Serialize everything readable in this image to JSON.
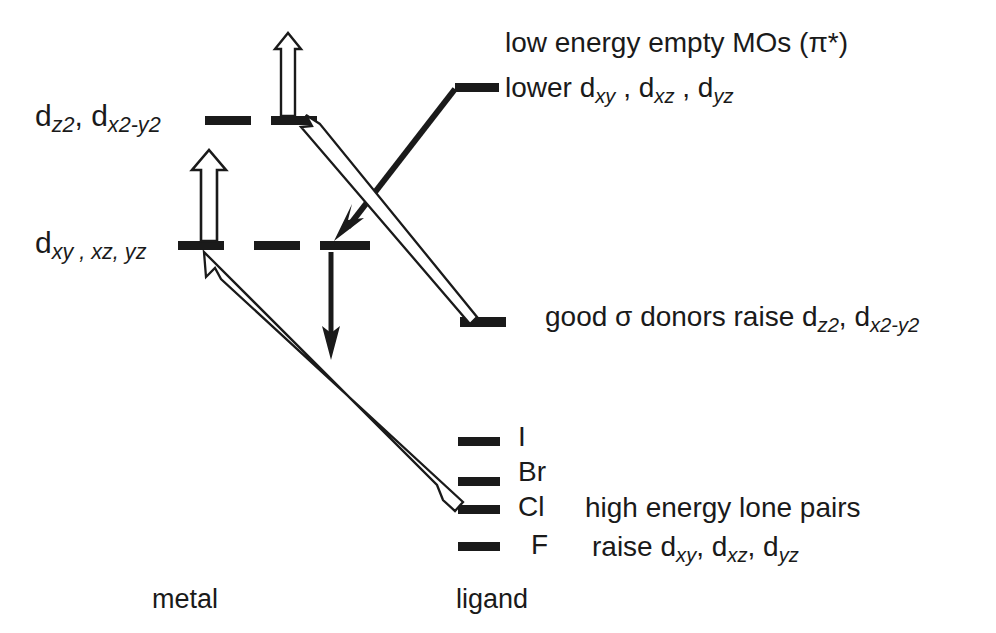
{
  "diagram": {
    "colors": {
      "level_bar": "#1a1a1a",
      "outline_arrow_fill": "#ffffff",
      "outline_arrow_stroke": "#1a1a1a",
      "solid_arrow": "#1a1a1a",
      "background": "#ffffff",
      "text": "#1a1a1a"
    },
    "axis_labels": {
      "metal": "metal",
      "ligand": "ligand"
    },
    "metal_levels": [
      {
        "id": "eg",
        "label_plain": "dz2, dx2-y2",
        "label_parts": [
          {
            "text": "d"
          },
          {
            "sub": "z2"
          },
          {
            "text": ", d"
          },
          {
            "sub": "x2-y2"
          }
        ],
        "bars": 2
      },
      {
        "id": "t2g",
        "label_plain": "dxy , xz, yz",
        "label_parts": [
          {
            "text": "d"
          },
          {
            "sub": "xy , xz, yz"
          }
        ],
        "bars": 3
      }
    ],
    "ligand_levels": [
      {
        "id": "pi-star",
        "annotation_line1": "low energy empty MOs (π*)",
        "annotation_line2": "lower dxy , dxz , dyz"
      },
      {
        "id": "sigma-donor",
        "annotation": "good σ donors raise dz2, dx2-y2"
      },
      {
        "id": "lone-pair-I",
        "label": "I"
      },
      {
        "id": "lone-pair-Br",
        "label": "Br"
      },
      {
        "id": "lone-pair-Cl",
        "label": "Cl"
      },
      {
        "id": "lone-pair-F",
        "label": "F"
      }
    ],
    "annotations": {
      "pi_star_line1": "low energy empty MOs (π*)",
      "pi_star_line2_prefix": "lower d",
      "pi_star_line2_sub1": "xy",
      "pi_star_line2_mid1": " , d",
      "pi_star_line2_sub2": "xz",
      "pi_star_line2_mid2": " , d",
      "pi_star_line2_sub3": "yz",
      "sigma_prefix": "good σ donors raise d",
      "sigma_sub1": "z2",
      "sigma_mid": ", d",
      "sigma_sub2": "x2-y2",
      "halide_I": "I",
      "halide_Br": "Br",
      "halide_Cl": "Cl",
      "halide_F": "F",
      "high_energy": "high energy lone pairs",
      "raise_prefix": "raise d",
      "raise_sub1": "xy",
      "raise_mid1": ", d",
      "raise_sub2": "xz",
      "raise_mid2": ", d",
      "raise_sub3": "yz"
    },
    "arrows": [
      {
        "id": "eg-up-outline",
        "style": "outline",
        "direction": "up",
        "meaning": "sigma donation raises eg"
      },
      {
        "id": "t2g-up-outline",
        "style": "outline",
        "direction": "up",
        "meaning": "lone pairs raise t2g"
      },
      {
        "id": "t2g-down-solid",
        "style": "solid",
        "direction": "down",
        "meaning": "pi* lowers t2g"
      },
      {
        "id": "pistar-to-t2g-solid",
        "style": "solid",
        "direction": "down-left",
        "meaning": "pi* interacts with t2g"
      },
      {
        "id": "sigma-to-eg-outline",
        "style": "outline",
        "direction": "up-left",
        "meaning": "sigma donor raises eg"
      },
      {
        "id": "lonepair-to-t2g-outline",
        "style": "outline",
        "direction": "up-left",
        "meaning": "halide lone pairs raise t2g"
      }
    ]
  }
}
